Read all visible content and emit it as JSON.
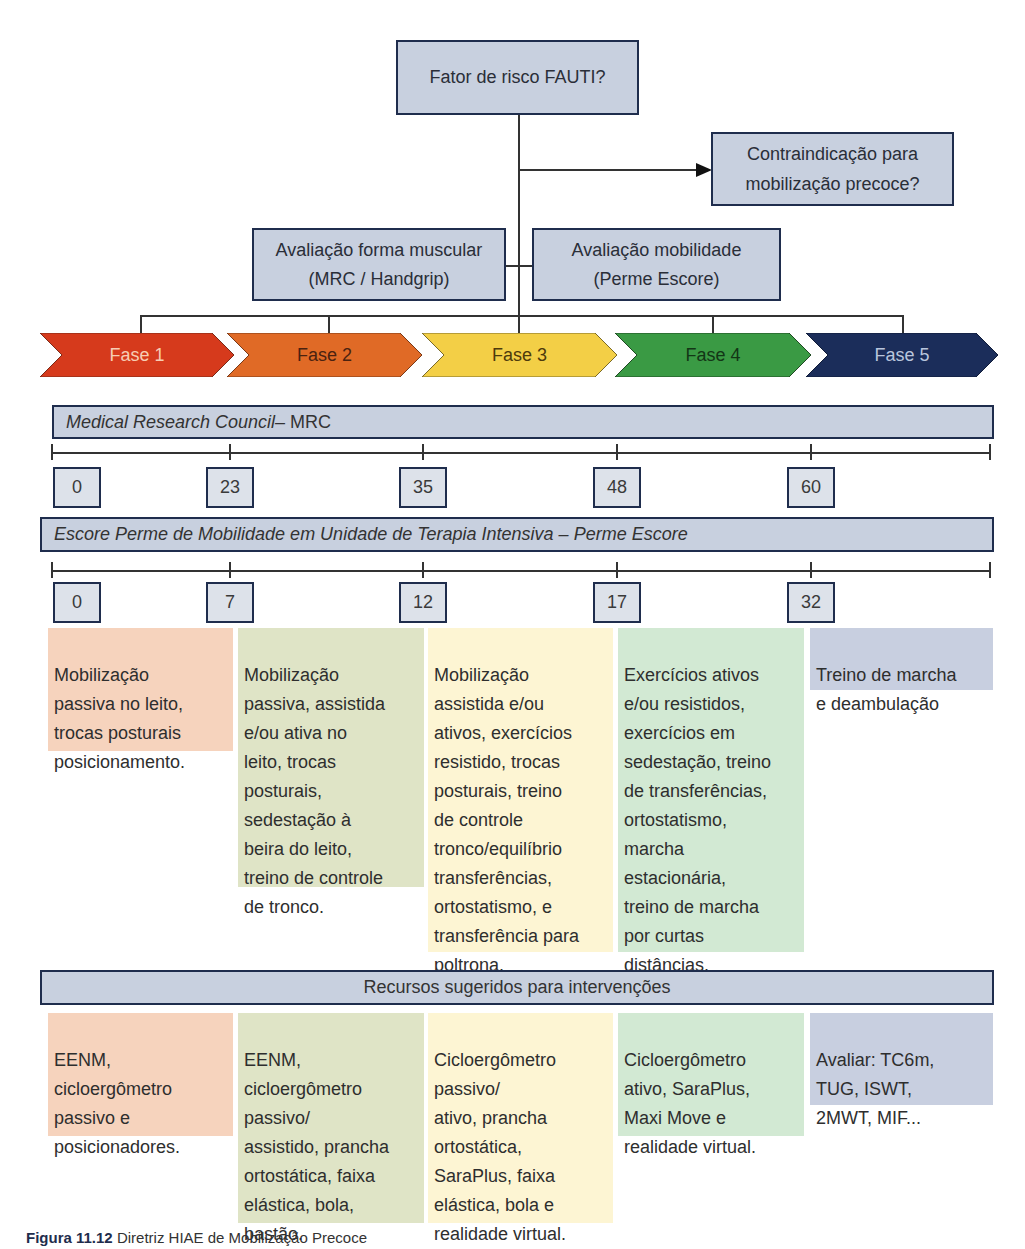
{
  "flow": {
    "top_box": "Fator de risco FAUTI?",
    "contraindication_box": "Contraindicação para\nmobilização precoce?",
    "muscle_eval_box": {
      "line1": "Avaliação forma muscular",
      "line2": "(MRC / Handgrip)"
    },
    "mobility_eval_box": {
      "line1": "Avaliação mobilidade",
      "line2": "(Perme Escore)"
    }
  },
  "phases": [
    {
      "label": "Fase 1",
      "color": "#d63a1c",
      "text_color": "#f7cdb4"
    },
    {
      "label": "Fase 2",
      "color": "#e06a26",
      "text_color": "#4a2210"
    },
    {
      "label": "Fase 3",
      "color": "#f3cf46",
      "text_color": "#4d3a0c"
    },
    {
      "label": "Fase 4",
      "color": "#3a9a44",
      "text_color": "#133616"
    },
    {
      "label": "Fase 5",
      "color": "#1b2d5a",
      "text_color": "#b9c5dd"
    }
  ],
  "mrc": {
    "title_italic": "Medical Research Council",
    "title_suffix": " – MRC",
    "values": [
      "0",
      "23",
      "35",
      "48",
      "60"
    ]
  },
  "perme": {
    "title": "Escore Perme de Mobilidade em Unidade de Terapia Intensiva – Perme Escore",
    "values": [
      "0",
      "7",
      "12",
      "17",
      "32"
    ]
  },
  "interventions": [
    {
      "text": "Mobilização\npassiva no leito,\ntrocas posturais\nposicionamento.",
      "color": "#f6d3bd"
    },
    {
      "text": "Mobilização\npassiva, assistida\ne/ou ativa no\nleito, trocas\nposturais,\nsedestação à\nbeira do leito,\ntreino de controle\nde tronco.",
      "color": "#dfe4c6"
    },
    {
      "text": "Mobilização\nassistida e/ou\nativos, exercícios\nresistido, trocas\nposturais, treino\nde controle\ntronco/equilíbrio\ntransferências,\nortostatismo, e\ntransferência para\npoltrona.",
      "color": "#fdf5d3"
    },
    {
      "text": "Exercícios ativos\ne/ou resistidos,\nexercícios em\nsedestação, treino\nde transferências,\nortostatismo,\nmarcha\nestacionária,\ntreino de marcha\npor curtas\ndistâncias.",
      "color": "#d2e9d3"
    },
    {
      "text": "Treino de marcha\ne deambulação",
      "color": "#c8cfe0"
    }
  ],
  "resources": {
    "title": "Recursos sugeridos para intervenções",
    "items": [
      {
        "text": "EENM,\ncicloergômetro\npassivo e\nposicionadores.",
        "color": "#f6d3bd"
      },
      {
        "text": "EENM,\ncicloergômetro\npassivo/\nassistido, prancha\nortostática, faixa\nelástica, bola,\nbastão.",
        "color": "#dfe4c6"
      },
      {
        "text": "Cicloergômetro\npassivo/\nativo, prancha\nortostática,\nSaraPlus, faixa\nelástica, bola e\nrealidade virtual.",
        "color": "#fdf5d3"
      },
      {
        "text": "Cicloergômetro\nativo, SaraPlus,\nMaxi Move e\nrealidade virtual.",
        "color": "#d2e9d3"
      },
      {
        "text": "Avaliar: TC6m,\nTUG, ISWT,\n2MWT, MIF...",
        "color": "#c8cfe0"
      }
    ]
  },
  "caption": {
    "label": "Figura 11.12",
    "text": " Diretriz HIAE de Mobilização Precoce"
  }
}
